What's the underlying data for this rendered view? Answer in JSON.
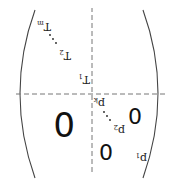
{
  "diagram": {
    "type": "block-matrix",
    "orientation": "rotated 180 degrees",
    "blocks": {
      "upper_left": {
        "label": "p",
        "subscripts": [
          "1",
          "2",
          "k"
        ],
        "ellipsis": "…"
      },
      "lower_right": {
        "label": "T",
        "subscripts": [
          "1",
          "2",
          "m"
        ],
        "ellipsis": "…"
      },
      "zero_blocks": [
        "0",
        "0",
        "0"
      ]
    }
  }
}
